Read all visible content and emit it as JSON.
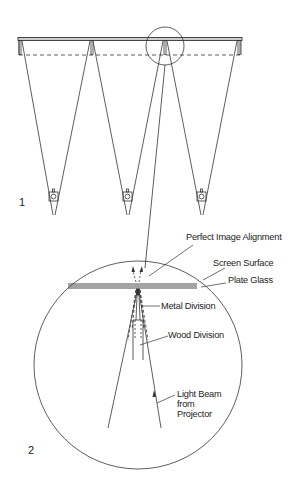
{
  "figure": {
    "panel_1_label": "1",
    "panel_2_label": "2",
    "stroke_color": "#333333",
    "background": "#ffffff"
  },
  "panel_1": {
    "description": "Three projectors casting overlapping images onto a long screen; detail circle at central division",
    "projector_count": 3,
    "screen_divisions": 4
  },
  "panel_2": {
    "labels": {
      "perfect_image_alignment": "Perfect Image Alignment",
      "screen_surface": "Screen Surface",
      "plate_glass": "Plate Glass",
      "metal_division": "Metal Division",
      "wood_division": "Wood Division",
      "light_beam_line1": "Light Beam",
      "light_beam_line2": "from",
      "light_beam_line3": "Projector"
    }
  }
}
